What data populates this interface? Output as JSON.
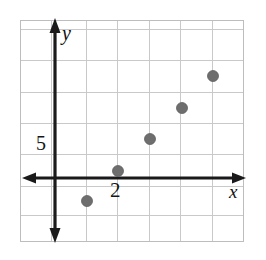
{
  "figure": {
    "name": "coordinate-plane-scatter-plot",
    "width": 266,
    "height": 260,
    "background_color": "#ffffff"
  },
  "axes": {
    "x_axis_label": "x",
    "y_axis_label": "y",
    "axis_color": "#1a1a1a",
    "axis_line_width": 3,
    "arrowheads": [
      "left",
      "right",
      "up",
      "down"
    ],
    "x_axis_pixel_y": 178,
    "y_axis_pixel_x": 55
  },
  "grid": {
    "show": true,
    "color": "#c9c9c9",
    "border_color": "#bdbdbd",
    "cell_size_px": 31,
    "left_px": 20,
    "top_px": 20,
    "right_px": 244,
    "bottom_px": 242,
    "vertical_lines_px": [
      20,
      51,
      86,
      117,
      149,
      180,
      212,
      243
    ],
    "horizontal_lines_px": [
      20,
      29,
      60,
      92,
      123,
      154,
      186,
      215,
      242
    ]
  },
  "tick_labels": [
    {
      "text": "5",
      "axis": "y",
      "value": 5
    },
    {
      "text": "2",
      "axis": "x",
      "value": 2
    }
  ],
  "chart_data": {
    "type": "scatter",
    "title": "",
    "xlabel": "x",
    "ylabel": "y",
    "grid": true,
    "legend": false,
    "x_tick_labels": [
      "2"
    ],
    "y_tick_labels": [
      "5"
    ],
    "xlim": [
      -2,
      12
    ],
    "ylim": [
      -5,
      20
    ],
    "marker": {
      "shape": "circle",
      "color": "#6e6e6e",
      "edge_color": "#5f5f5f",
      "size_px": 11
    },
    "points": [
      {
        "x": 2,
        "y": -2.5,
        "px": 87,
        "py": 201
      },
      {
        "x": 4,
        "y": 1.0,
        "px": 118,
        "py": 171
      },
      {
        "x": 6,
        "y": 6.0,
        "px": 150,
        "py": 139
      },
      {
        "x": 8,
        "y": 11.0,
        "px": 182,
        "py": 108
      },
      {
        "x": 10,
        "y": 16.0,
        "px": 213,
        "py": 76
      }
    ],
    "x_values": [
      2,
      4,
      6,
      8,
      10
    ],
    "y_values": [
      -2.5,
      1.0,
      6.0,
      11.0,
      16.0
    ]
  }
}
